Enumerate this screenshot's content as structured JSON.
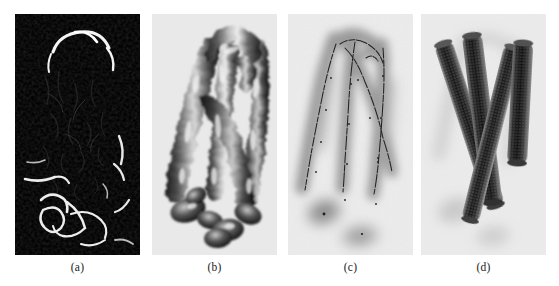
{
  "figure": {
    "kind": "multi-panel-image-figure",
    "panel_count": 4,
    "background_color": "#ffffff"
  },
  "panels": [
    {
      "id": "a",
      "caption": "(a)",
      "description": "binary/thresholded MRA maximum-intensity vessel mask",
      "background_color": "#030303",
      "foreground_color": "#f2f2f2",
      "style": "bright thin filaments on black background"
    },
    {
      "id": "b",
      "caption": "(b)",
      "description": "shaded 3D isosurface rendering of vessel tubes",
      "background_color": "#e9e9e9",
      "foreground_color": "#3c3c3c",
      "style": "grayscale shaded organic tubular surfaces with specular highlights"
    },
    {
      "id": "c",
      "caption": "(c)",
      "description": "blurred grayscale vessel volume with extracted dark centerlines",
      "background_color": "#ececec",
      "foreground_color": "#8c8c8c",
      "centerline_color": "#1e1e1e",
      "style": "diffuse gray tubes with thin dark skeleton curves"
    },
    {
      "id": "d",
      "caption": "(d)",
      "description": "reconstructed straight cylindrical vessel models with stippled texture",
      "background_color": "#ebebeb",
      "foreground_color": "#2b2b2b",
      "style": "four dark stippled cylinders over faint blurred blobs"
    }
  ],
  "captions": {
    "a": "(a)",
    "b": "(b)",
    "c": "(c)",
    "d": "(d)"
  }
}
